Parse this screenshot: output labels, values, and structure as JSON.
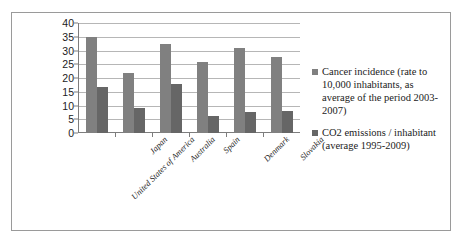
{
  "chart_data": {
    "type": "bar",
    "title": "",
    "xlabel": "",
    "ylabel": "",
    "ylim": [
      0,
      40
    ],
    "ytick_values": [
      40,
      35,
      30,
      25,
      20,
      15,
      10,
      5,
      0
    ],
    "grid": true,
    "legend_position": "right",
    "categories": [
      "United States of America",
      "Japan",
      "Australia",
      "Spain",
      "Denmark",
      "Slovakia"
    ],
    "series": [
      {
        "name": "Cancer incidence (rate to 10,000 inhabitants, as average of the period 2003-2007)",
        "color": "#808080",
        "values": [
          35,
          22,
          32.5,
          26,
          30.8,
          27.6
        ]
      },
      {
        "name": "CO2 emissions / inhabitant (average 1995-2009)",
        "color": "#666666",
        "values": [
          16.8,
          9.2,
          18,
          6.2,
          7.8,
          8
        ]
      }
    ]
  },
  "legend": {
    "entries": [
      {
        "label": "Cancer incidence (rate to 10,000 inhabitants, as average of the period 2003-2007)",
        "swatch": "legend-swatch-series-1"
      },
      {
        "label": "CO2 emissions / inhabitant (average 1995-2009)",
        "swatch": "legend-swatch-series-2"
      }
    ]
  },
  "colors": {
    "series_1": "#808080",
    "series_2": "#666666",
    "gridline": "#b6b6b6",
    "axis": "#7d7d7d",
    "border": "#9a9a9a",
    "text": "#1b1b1b",
    "background": "#ffffff"
  }
}
